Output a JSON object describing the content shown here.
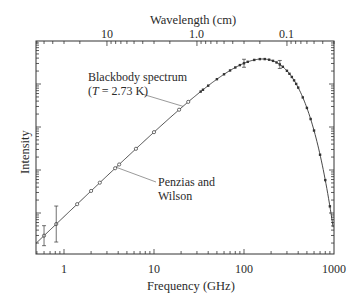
{
  "chart_data": {
    "type": "line",
    "title": "",
    "xlabel": "Frequency (GHz)",
    "ylabel": "Intensity",
    "x2label": "Wavelength (cm)",
    "xscale": "log",
    "yscale": "log",
    "xlim": [
      0.5,
      1000
    ],
    "x_ticks": [
      1,
      10,
      100,
      1000
    ],
    "x_tick_labels": [
      "1",
      "10",
      "100",
      "1000"
    ],
    "x2_ticks_cm": [
      10,
      1.0,
      0.1
    ],
    "x2_tick_labels": [
      "10",
      "1.0",
      "0.1"
    ],
    "y_tick_labels": [],
    "grid": false,
    "legend": null,
    "series": [
      {
        "name": "Blackbody spectrum (T = 2.73 K)",
        "kind": "curve",
        "temperature_K": 2.73
      },
      {
        "name": "Measurements",
        "kind": "points",
        "x_GHz": [
          0.6,
          0.82,
          1.4,
          2.0,
          2.5,
          3.7,
          4.1,
          6.3,
          10.0,
          19.0,
          24.0,
          33.0,
          35.0,
          40,
          50,
          60,
          70,
          80,
          90,
          100,
          110,
          130,
          150,
          170,
          190,
          210,
          230,
          250,
          270,
          300,
          320,
          340,
          360,
          380,
          400,
          450,
          500,
          550,
          600,
          700,
          800,
          900
        ],
        "y_relative": "follows blackbody curve",
        "error_bars_at_GHz": [
          0.6,
          0.82,
          100,
          250
        ]
      }
    ],
    "annotations": [
      {
        "text": "Blackbody spectrum",
        "line2": "(T = 2.73 K)",
        "points_to_GHz": 21
      },
      {
        "text": "Penzias and",
        "line2": "Wilson",
        "points_to_GHz": 3.8
      }
    ]
  },
  "labels": {
    "x2title": "Wavelength (cm)",
    "x2ticks": [
      "10",
      "1.0",
      "0.1"
    ],
    "xticks": [
      "1",
      "10",
      "100",
      "1000"
    ],
    "xtitle": "Frequency (GHz)",
    "ytitle": "Intensity",
    "bb_line1": "Blackbody spectrum",
    "bb_T_open": "(",
    "bb_T_var": "T",
    "bb_T_rest": " = 2.73 K)",
    "pw_line1": "Penzias and",
    "pw_line2": "Wilson"
  }
}
